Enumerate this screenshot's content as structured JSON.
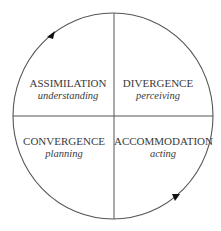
{
  "colors": {
    "line": "#555555",
    "text": "#3a3a3a",
    "arrow": "#111111",
    "background": "#ffffff"
  },
  "diagram": {
    "type": "cycle-quadrant",
    "quadrants": [
      {
        "position": "top-left",
        "title": "ASSIMILATION",
        "subtitle": "understanding"
      },
      {
        "position": "top-right",
        "title": "DIVERGENCE",
        "subtitle": "perceiving"
      },
      {
        "position": "bottom-left",
        "title": "CONVERGENCE",
        "subtitle": "planning"
      },
      {
        "position": "bottom-right",
        "title": "ACCOMMODATION",
        "subtitle": "acting"
      }
    ],
    "arrows": [
      {
        "position": "top-left-arc",
        "icon": "arrowhead-icon"
      },
      {
        "position": "bottom-right-arc",
        "icon": "arrowhead-icon"
      }
    ]
  }
}
